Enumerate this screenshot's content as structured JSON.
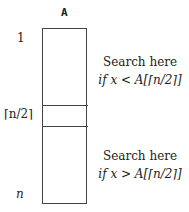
{
  "diagram": {
    "array_label": "A",
    "indices": {
      "first": "1",
      "middle": "⌈n/2⌉",
      "last": "n"
    },
    "annotations": {
      "upper": {
        "line1": "Search here",
        "line2": "if x < A[⌈n/2⌉]"
      },
      "lower": {
        "line1": "Search here",
        "line2": "if x > A[⌈n/2⌉]"
      }
    },
    "colors": {
      "stroke": "#444444",
      "text": "#222222",
      "background": "#ffffff"
    }
  }
}
